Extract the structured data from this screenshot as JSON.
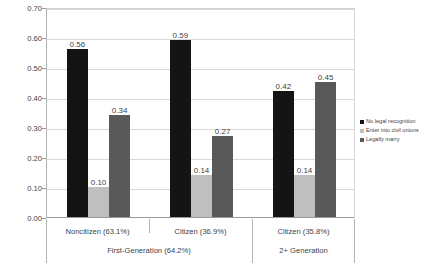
{
  "chart_data": {
    "type": "bar",
    "title": "",
    "xlabel": "",
    "ylabel": "Proportion",
    "ylim": [
      0.0,
      0.7
    ],
    "ytick_labels": [
      "0.00",
      "0.10",
      "0.20",
      "0.30",
      "0.40",
      "0.50",
      "0.60",
      "0.70"
    ],
    "ytick_values": [
      0.0,
      0.1,
      0.2,
      0.3,
      0.4,
      0.5,
      0.6,
      0.7
    ],
    "grid": true,
    "legend_position": "right",
    "categories": [
      "Noncitizen (63.1%)",
      "Citizen (36.9%)",
      "Citizen (35.8%)"
    ],
    "group_labels": [
      "First-Generation (64.2%)",
      "2+ Generation"
    ],
    "group_spans": [
      2,
      1
    ],
    "series": [
      {
        "name": "No legal recognition",
        "color": "#141414",
        "values": [
          0.56,
          0.59,
          0.42
        ],
        "labels": [
          "0.56",
          "0.59",
          "0.42"
        ]
      },
      {
        "name": "Enter into civil unions",
        "color": "#bfbfbf",
        "values": [
          0.1,
          0.14,
          0.14
        ],
        "labels": [
          "0.10",
          "0.14",
          "0.14"
        ]
      },
      {
        "name": "Legally marry",
        "color": "#595959",
        "values": [
          0.34,
          0.27,
          0.45
        ],
        "labels": [
          "0.34",
          "0.27",
          "0.45"
        ]
      }
    ]
  }
}
